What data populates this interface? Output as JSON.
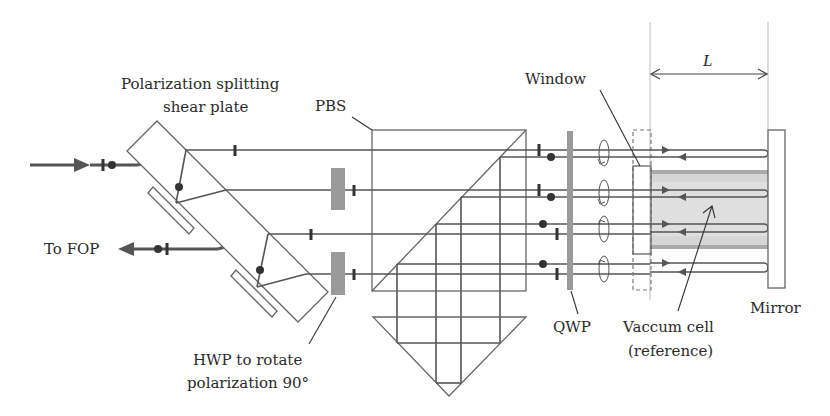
{
  "diagram": {
    "type": "optical-schematic",
    "labels": {
      "shear_plate_line1": "Polarization splitting",
      "shear_plate_line2": "shear plate",
      "pbs": "PBS",
      "window": "Window",
      "length": "L",
      "to_fop": "To FOP",
      "hwp_line1": "HWP to rotate",
      "hwp_line2": "polarization 90°",
      "qwp": "QWP",
      "vacuum_line1": "Vaccum cell",
      "vacuum_line2": "(reference)",
      "mirror": "Mirror"
    },
    "components": [
      {
        "id": "input-beam",
        "name": "Input beam"
      },
      {
        "id": "shear-plate",
        "name": "Polarization splitting shear plate"
      },
      {
        "id": "hwp",
        "name": "HWP to rotate polarization 90°"
      },
      {
        "id": "pbs",
        "name": "PBS"
      },
      {
        "id": "corner-prism",
        "name": "Retro-reflecting prism"
      },
      {
        "id": "qwp",
        "name": "QWP"
      },
      {
        "id": "window",
        "name": "Window"
      },
      {
        "id": "vacuum-cell",
        "name": "Vaccum cell (reference)"
      },
      {
        "id": "mirror",
        "name": "Mirror"
      },
      {
        "id": "output-beam",
        "name": "To FOP"
      }
    ],
    "colors": {
      "line": "#555555",
      "plate": "#9a9a9a",
      "cell": "#d6d6d6",
      "text": "#2a2a2a"
    }
  }
}
